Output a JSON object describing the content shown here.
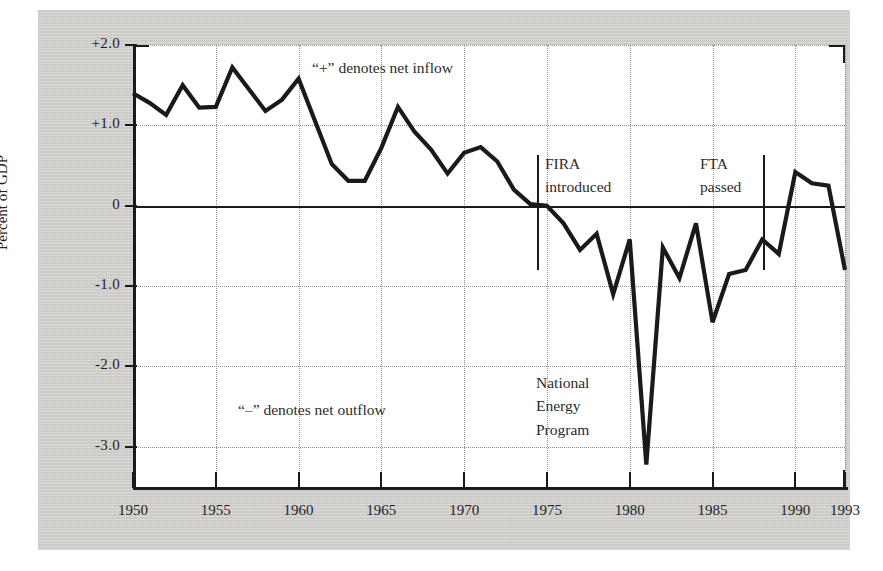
{
  "chart_data": {
    "type": "line",
    "title": "",
    "xlabel": "",
    "ylabel": "Percent of GDP",
    "xlim": [
      1950,
      1993
    ],
    "ylim": [
      -3.5,
      2.0
    ],
    "grid": true,
    "legend": "none",
    "x_ticks": [
      "1950",
      "1955",
      "1960",
      "1965",
      "1970",
      "1975",
      "1980",
      "1985",
      "1990",
      "1993"
    ],
    "x_tick_values": [
      1950,
      1955,
      1960,
      1965,
      1970,
      1975,
      1980,
      1985,
      1990,
      1993
    ],
    "y_ticks": [
      "+2.0",
      "+1.0",
      "0",
      "-1.0",
      "-2.0",
      "-3.0"
    ],
    "y_tick_values": [
      2.0,
      1.0,
      0,
      -1.0,
      -2.0,
      -3.0
    ],
    "series": [
      {
        "name": "Net foreign direct investment",
        "x": [
          1950,
          1951,
          1952,
          1953,
          1954,
          1955,
          1956,
          1957,
          1958,
          1959,
          1960,
          1961,
          1962,
          1963,
          1964,
          1965,
          1966,
          1967,
          1968,
          1969,
          1970,
          1971,
          1972,
          1973,
          1974,
          1975,
          1976,
          1977,
          1978,
          1979,
          1980,
          1981,
          1982,
          1983,
          1984,
          1985,
          1986,
          1987,
          1988,
          1989,
          1990,
          1991,
          1992,
          1993
        ],
        "values": [
          1.4,
          1.28,
          1.13,
          1.5,
          1.22,
          1.23,
          1.72,
          1.45,
          1.18,
          1.32,
          1.58,
          1.05,
          0.52,
          0.31,
          0.31,
          0.72,
          1.23,
          0.92,
          0.7,
          0.4,
          0.66,
          0.73,
          0.55,
          0.2,
          0.02,
          0.0,
          -0.22,
          -0.55,
          -0.35,
          -1.1,
          -0.42,
          -3.22,
          -0.52,
          -0.9,
          -0.22,
          -1.45,
          -0.85,
          -0.8,
          -0.42,
          -0.6,
          0.42,
          0.28,
          0.25,
          -0.8
        ]
      }
    ],
    "annotations": [
      {
        "id": "plus-note",
        "text": "“+” denotes net inflow"
      },
      {
        "id": "minus-note",
        "text": "“–” denotes net outflow"
      },
      {
        "id": "fira-note",
        "lines": [
          "FIRA",
          "introduced"
        ],
        "year": 1975
      },
      {
        "id": "nep-note",
        "lines": [
          "National",
          "Energy",
          "Program"
        ],
        "year": 1980
      },
      {
        "id": "fta-note",
        "lines": [
          "FTA",
          "passed"
        ],
        "year": 1989
      }
    ],
    "colors": {
      "line": "#1a1a1a",
      "page_background": "#cfcdc9",
      "plot_background": "#ffffff",
      "grid": "#8d8d8d",
      "axis": "#1a1a1a"
    }
  }
}
